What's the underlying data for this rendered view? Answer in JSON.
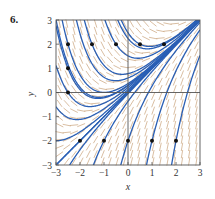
{
  "problem_number": "6.",
  "chart_data": {
    "type": "line",
    "subtype": "slope-field-with-solution-curves",
    "title": "",
    "xlabel": "x",
    "ylabel": "y",
    "xlim": [
      -3,
      3
    ],
    "ylim": [
      -3,
      3
    ],
    "x_ticks": [
      "-3",
      "-2",
      "-1",
      "0",
      "1",
      "2",
      "3"
    ],
    "y_ticks": [
      "-3",
      "-2",
      "-1",
      "0",
      "1",
      "2",
      "3"
    ],
    "grid": false,
    "axes_lines": {
      "x_axis": true,
      "y_axis": true
    },
    "legend": null,
    "slope_field_grid_step": 0.3,
    "colors": {
      "curve": "#2a5fb5",
      "slope": "#c9a27a",
      "point": "#111111",
      "frame": "#555555"
    },
    "initial_points": [
      {
        "x": -2.5,
        "y": 2
      },
      {
        "x": -1.5,
        "y": 2
      },
      {
        "x": -0.5,
        "y": 2
      },
      {
        "x": 0.5,
        "y": 2
      },
      {
        "x": 1.5,
        "y": 2
      },
      {
        "x": -2.5,
        "y": 1
      },
      {
        "x": -2.5,
        "y": 0
      },
      {
        "x": -2,
        "y": -2
      },
      {
        "x": -1,
        "y": -2
      },
      {
        "x": 0,
        "y": -2
      },
      {
        "x": 1,
        "y": -2
      },
      {
        "x": 2,
        "y": -2
      }
    ],
    "solution_family": "y = x + C*exp(-x)",
    "extra_curve_constants": [
      0,
      0.05,
      -0.05,
      0.12,
      0.3,
      0.6
    ]
  }
}
